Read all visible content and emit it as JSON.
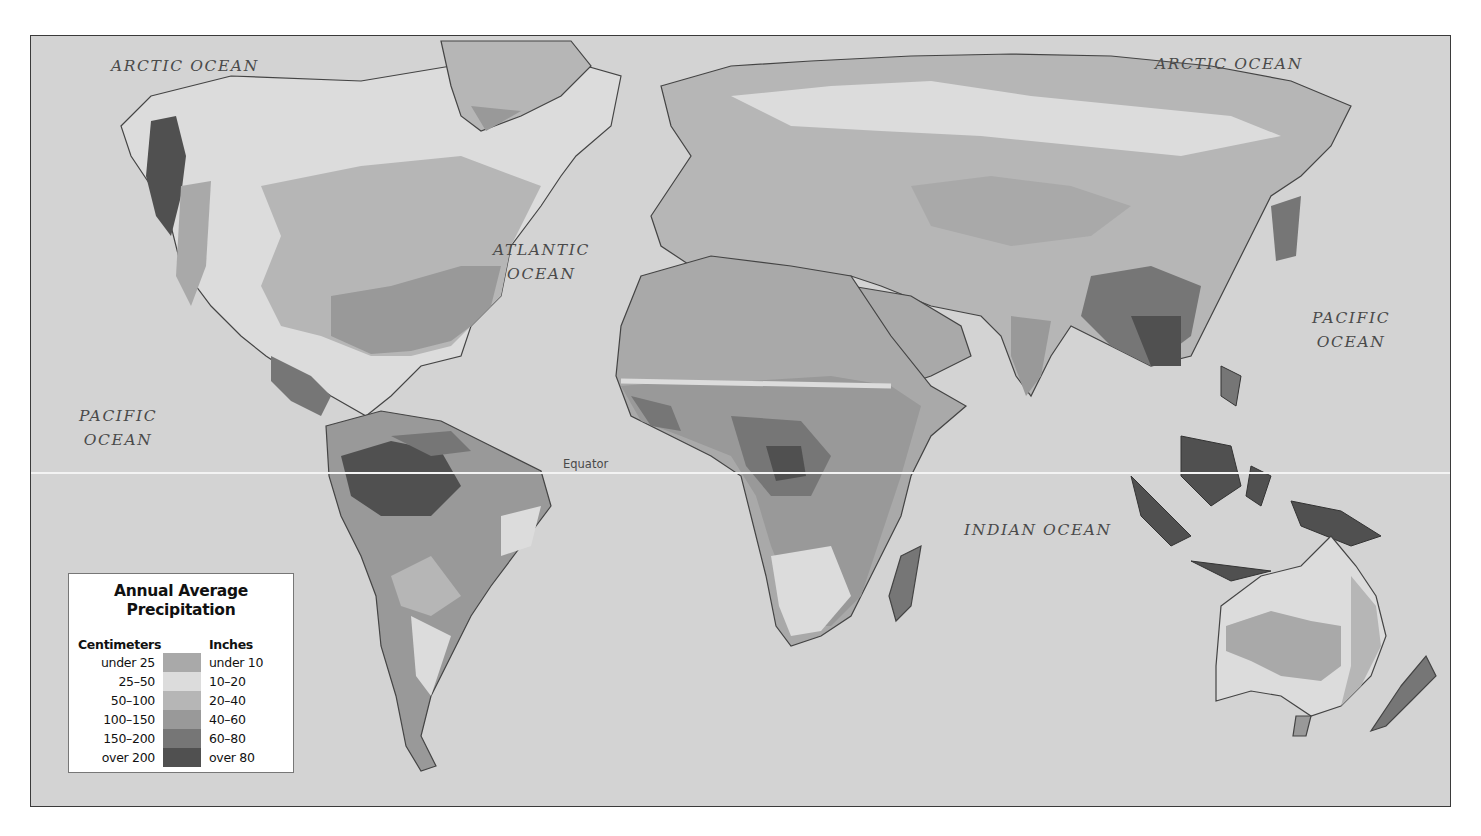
{
  "map": {
    "title": "Annual Average Precipitation",
    "type": "thematic world map (choropleth, grayscale)",
    "ocean_color": "#d3d3d3",
    "ocean_labels": [
      {
        "text_line1": "ARCTIC OCEAN",
        "text_line2": "",
        "position": "top-left"
      },
      {
        "text_line1": "ARCTIC OCEAN",
        "text_line2": "",
        "position": "top-right"
      },
      {
        "text_line1": "ATLANTIC",
        "text_line2": "OCEAN",
        "position": "center-north"
      },
      {
        "text_line1": "PACIFIC",
        "text_line2": "OCEAN",
        "position": "left"
      },
      {
        "text_line1": "PACIFIC",
        "text_line2": "OCEAN",
        "position": "right"
      },
      {
        "text_line1": "INDIAN OCEAN",
        "text_line2": "",
        "position": "center-south"
      }
    ],
    "equator_label": "Equator"
  },
  "legend": {
    "title_line1": "Annual Average",
    "title_line2": "Precipitation",
    "col_cm": "Centimeters",
    "col_in": "Inches",
    "rows": [
      {
        "cm": "under 25",
        "in": "under 10",
        "color": "#a9a9a9"
      },
      {
        "cm": "25–50",
        "in": "10–20",
        "color": "#dcdcdc"
      },
      {
        "cm": "50–100",
        "in": "20–40",
        "color": "#b6b6b6"
      },
      {
        "cm": "100–150",
        "in": "40–60",
        "color": "#999999"
      },
      {
        "cm": "150–200",
        "in": "60–80",
        "color": "#767676"
      },
      {
        "cm": "over 200",
        "in": "over 80",
        "color": "#505050"
      }
    ]
  }
}
